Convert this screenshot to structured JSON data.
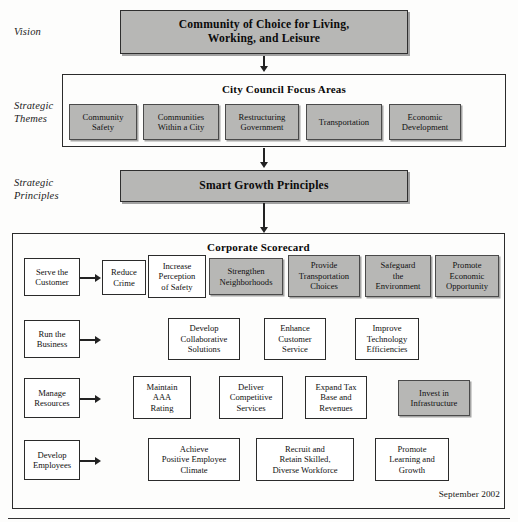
{
  "diagram": {
    "date_stamp": "September 2002",
    "stages": [
      {
        "id": "vision",
        "label": "Vision"
      },
      {
        "id": "strategic-themes",
        "label": "Strategic\nThemes"
      },
      {
        "id": "strategic-principles",
        "label": "Strategic\nPrinciples"
      }
    ],
    "vision_banner": {
      "text": "Community of Choice for Living,\nWorking, and Leisure",
      "shaded": true
    },
    "focus_areas": {
      "title": "City Council Focus Areas",
      "boxes": [
        {
          "text": "Community\nSafety",
          "shaded": true
        },
        {
          "text": "Communities\nWithin a City",
          "shaded": true
        },
        {
          "text": "Restructuring\nGovernment",
          "shaded": true
        },
        {
          "text": "Transportation",
          "shaded": true
        },
        {
          "text": "Economic\nDevelopment",
          "shaded": true
        }
      ]
    },
    "principles_banner": {
      "text": "Smart Growth Principles",
      "shaded": true
    },
    "scorecard": {
      "title": "Corporate Scorecard",
      "rows": [
        {
          "perspective": "Serve the\nCustomer",
          "objectives": [
            {
              "text": "Reduce\nCrime",
              "shaded": false
            },
            {
              "text": "Increase\nPerception\nof Safety",
              "shaded": false
            },
            {
              "text": "Strengthen\nNeighborhoods",
              "shaded": true
            },
            {
              "text": "Provide\nTransportation\nChoices",
              "shaded": true
            },
            {
              "text": "Safeguard\nthe\nEnvironment",
              "shaded": true
            },
            {
              "text": "Promote\nEconomic\nOpportunity",
              "shaded": true
            }
          ]
        },
        {
          "perspective": "Run the\nBusiness",
          "objectives": [
            {
              "text": "Develop\nCollaborative\nSolutions",
              "shaded": false
            },
            {
              "text": "Enhance\nCustomer\nService",
              "shaded": false
            },
            {
              "text": "Improve\nTechnology\nEfficiencies",
              "shaded": false
            }
          ]
        },
        {
          "perspective": "Manage\nResources",
          "objectives": [
            {
              "text": "Maintain\nAAA\nRating",
              "shaded": false
            },
            {
              "text": "Deliver\nCompetitive\nServices",
              "shaded": false
            },
            {
              "text": "Expand Tax\nBase and\nRevenues",
              "shaded": false
            },
            {
              "text": "Invest in\nInfrastructure",
              "shaded": true
            }
          ]
        },
        {
          "perspective": "Develop\nEmployees",
          "objectives": [
            {
              "text": "Achieve\nPositive Employee\nClimate",
              "shaded": false
            },
            {
              "text": "Recruit and\nRetain Skilled,\nDiverse Workforce",
              "shaded": false
            },
            {
              "text": "Promote\nLearning and\nGrowth",
              "shaded": false
            }
          ]
        }
      ]
    },
    "colors": {
      "shade_fill": "#b7b7b5",
      "border": "#2b2b2b",
      "text": "#101010",
      "page_background": "#fdfdfc"
    }
  }
}
